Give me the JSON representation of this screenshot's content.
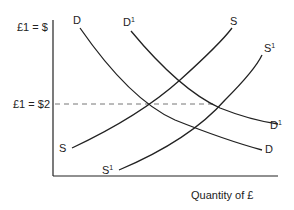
{
  "diagram": {
    "y_axis_top_label": "£1 = $",
    "y_axis_value_label": "£1 = $2",
    "x_axis_label": "Quantity of £",
    "curves": {
      "D": {
        "label": "D",
        "sup": "",
        "label_end": "D",
        "label_end_sup": ""
      },
      "D1": {
        "label": "D",
        "sup": "1",
        "label_end": "D",
        "label_end_sup": "1"
      },
      "S": {
        "label": "S",
        "sup": "",
        "label_end": "S",
        "label_end_sup": ""
      },
      "S1": {
        "label": "S",
        "sup": "1",
        "label_end": "S",
        "label_end_sup": "1"
      }
    },
    "colors": {
      "line": "#222222",
      "dash": "#777777",
      "background": "#ffffff"
    }
  }
}
